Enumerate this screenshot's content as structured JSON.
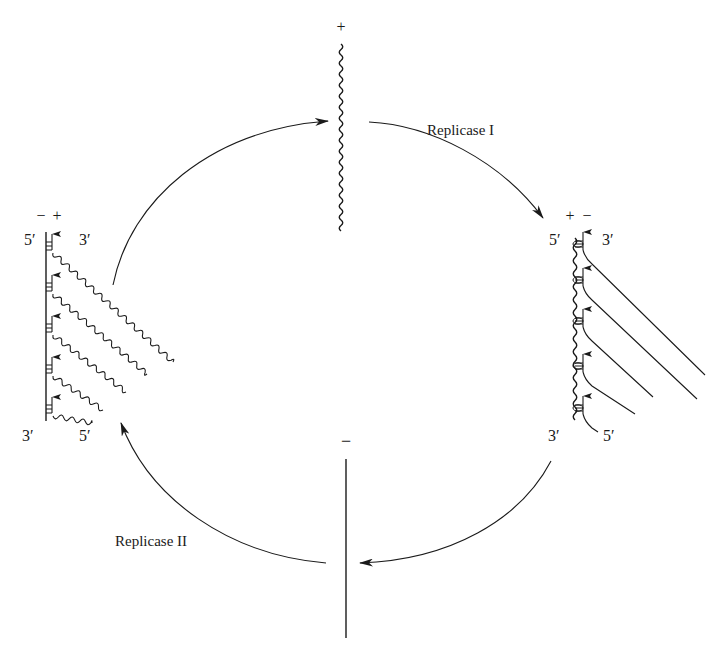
{
  "diagram": {
    "colors": {
      "ink": "#1a1a1a",
      "background": "#ffffff"
    },
    "top_strand": {
      "polarity": "+",
      "type": "wavy"
    },
    "bottom_strand": {
      "polarity": "−",
      "type": "straight"
    },
    "right_complex": {
      "template_polarity": "+",
      "product_polarity": "−",
      "template_label_top": "5′",
      "template_label_bottom": "3′",
      "product_label_top": "3′",
      "product_label_bottom": "5′",
      "growing_chains": 5
    },
    "left_complex": {
      "template_polarity": "−",
      "product_polarity": "+",
      "template_label_top": "5′",
      "template_label_bottom": "3′",
      "product_label_top": "3′",
      "product_label_bottom": "5′",
      "growing_chains": 5
    },
    "enzymes": {
      "replicase_1": "Replicase I",
      "replicase_2": "Replicase II"
    },
    "arrows": [
      {
        "from": "left_complex",
        "to": "top_strand"
      },
      {
        "from": "top_strand",
        "to": "right_complex",
        "label": "Replicase I"
      },
      {
        "from": "right_complex",
        "to": "bottom_strand"
      },
      {
        "from": "bottom_strand",
        "to": "left_complex",
        "label": "Replicase II"
      }
    ]
  }
}
